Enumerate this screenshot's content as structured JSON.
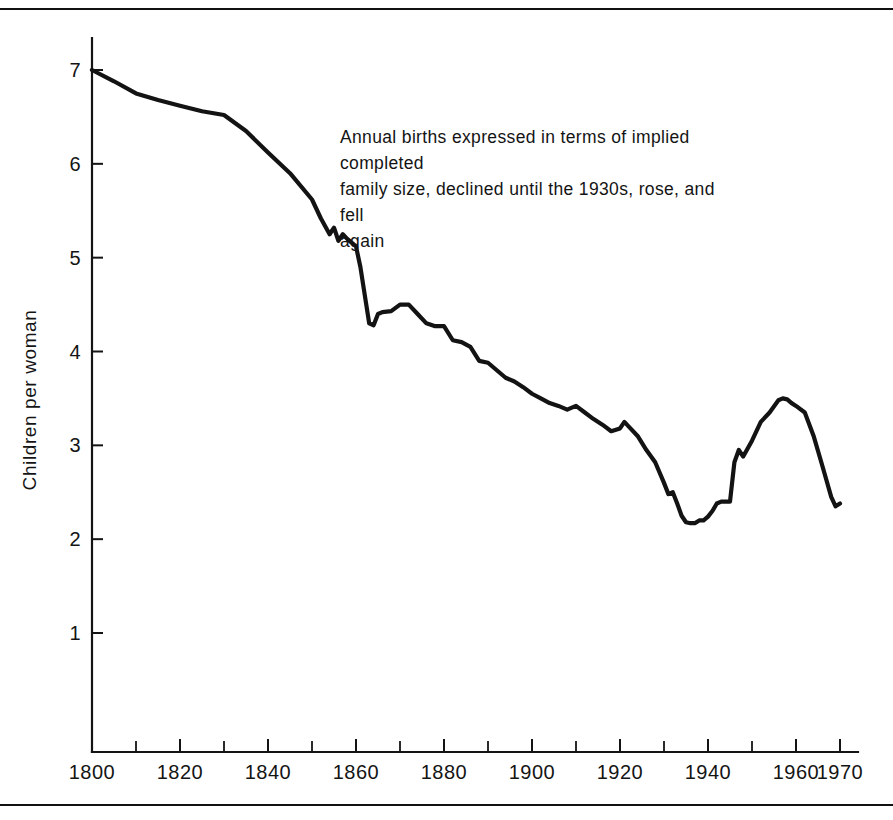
{
  "figure": {
    "annotation": "Annual births expressed in terms of implied completed\nfamily size, declined until the 1930s, rose, and fell\nagain",
    "line_color": "#131313",
    "axis_color": "#141414",
    "background": "#ffffff"
  },
  "chart_data": {
    "type": "line",
    "title": "",
    "subtitle": "",
    "xlabel": "",
    "ylabel": "Children per woman",
    "xlim": [
      1800,
      1972
    ],
    "ylim": [
      0,
      7.35
    ],
    "grid": false,
    "legend": null,
    "annotations": [
      {
        "text": "Annual births expressed in terms of implied completed family size, declined until the 1930s, rose, and fell again",
        "x": 1855,
        "y": 6.3
      }
    ],
    "x_ticks": [
      1800,
      1820,
      1840,
      1860,
      1880,
      1900,
      1920,
      1940,
      1960,
      1970
    ],
    "x_tick_labels": [
      "1800",
      "1820",
      "1840",
      "1860",
      "1880",
      "1900",
      "1920",
      "1940",
      "1960",
      "1970"
    ],
    "x_minor_ticks": [
      1810,
      1830,
      1850,
      1870,
      1890,
      1910,
      1930,
      1950
    ],
    "y_ticks": [
      1,
      2,
      3,
      4,
      5,
      6,
      7
    ],
    "y_tick_labels": [
      "1",
      "2",
      "3",
      "4",
      "5",
      "6",
      "7"
    ],
    "series": [
      {
        "name": "Children per woman",
        "x": [
          1800,
          1805,
          1810,
          1815,
          1820,
          1825,
          1830,
          1835,
          1840,
          1845,
          1850,
          1852,
          1854,
          1855,
          1856,
          1857,
          1858,
          1860,
          1861,
          1862,
          1863,
          1864,
          1865,
          1866,
          1868,
          1870,
          1872,
          1874,
          1876,
          1878,
          1880,
          1882,
          1884,
          1886,
          1888,
          1890,
          1892,
          1894,
          1896,
          1898,
          1900,
          1902,
          1904,
          1906,
          1908,
          1910,
          1912,
          1914,
          1916,
          1918,
          1920,
          1921,
          1922,
          1924,
          1926,
          1928,
          1930,
          1931,
          1932,
          1933,
          1934,
          1935,
          1936,
          1937,
          1938,
          1939,
          1940,
          1941,
          1942,
          1943,
          1944,
          1945,
          1946,
          1947,
          1948,
          1950,
          1952,
          1954,
          1956,
          1957,
          1958,
          1959,
          1960,
          1962,
          1964,
          1966,
          1968,
          1969,
          1970
        ],
        "y": [
          7.0,
          6.88,
          6.75,
          6.68,
          6.62,
          6.56,
          6.52,
          6.35,
          6.12,
          5.9,
          5.62,
          5.42,
          5.25,
          5.32,
          5.18,
          5.25,
          5.2,
          5.12,
          4.9,
          4.6,
          4.3,
          4.28,
          4.4,
          4.42,
          4.43,
          4.5,
          4.5,
          4.4,
          4.3,
          4.27,
          4.27,
          4.12,
          4.1,
          4.05,
          3.9,
          3.88,
          3.8,
          3.72,
          3.68,
          3.62,
          3.55,
          3.5,
          3.45,
          3.42,
          3.38,
          3.42,
          3.35,
          3.28,
          3.22,
          3.15,
          3.18,
          3.25,
          3.2,
          3.1,
          2.95,
          2.82,
          2.6,
          2.48,
          2.5,
          2.38,
          2.25,
          2.18,
          2.17,
          2.17,
          2.2,
          2.2,
          2.24,
          2.3,
          2.38,
          2.4,
          2.4,
          2.4,
          2.82,
          2.95,
          2.88,
          3.05,
          3.25,
          3.35,
          3.48,
          3.5,
          3.49,
          3.45,
          3.42,
          3.35,
          3.1,
          2.78,
          2.45,
          2.35,
          2.38
        ]
      }
    ]
  }
}
